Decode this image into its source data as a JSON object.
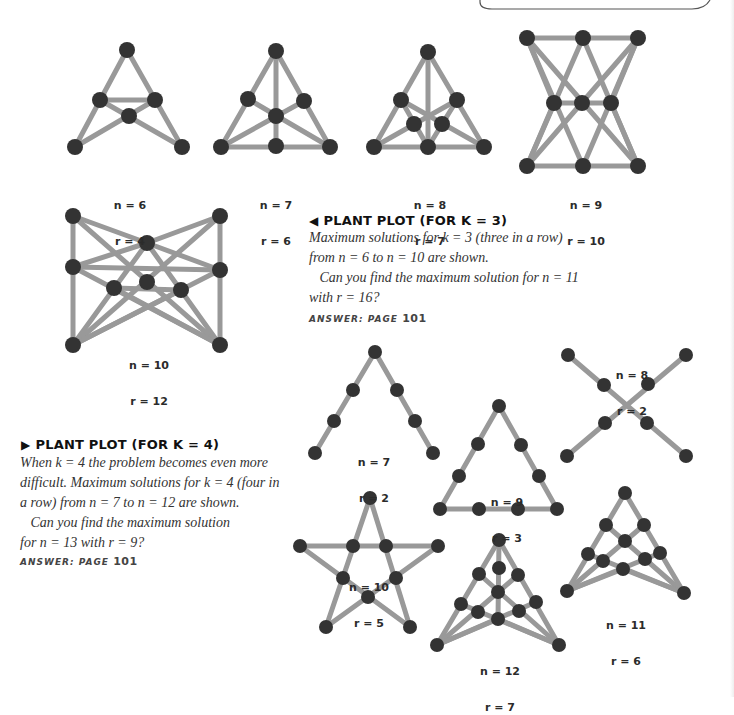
{
  "page": {
    "colors": {
      "edge": "#999999",
      "node": "#333333",
      "text": "#333333",
      "background": "#ffffff"
    }
  },
  "section_k3": {
    "heading_arrow": "◀",
    "heading": "PLANT PLOT (FOR K = 3)",
    "body_lines": [
      "Maximum solutions for k = 3 (three in a row)",
      "from n = 6 to n = 10 are shown.",
      "   Can you find the maximum solution for n = 11",
      "with r = 16?"
    ],
    "answer_label": "ANSWER: PAGE ",
    "answer_page": "101",
    "figures": [
      {
        "n_label": "n = 6",
        "r_label": "r = 4"
      },
      {
        "n_label": "n = 7",
        "r_label": "r = 6"
      },
      {
        "n_label": "n = 8",
        "r_label": "r = 7"
      },
      {
        "n_label": "n = 9",
        "r_label": "r = 10"
      },
      {
        "n_label": "n = 10",
        "r_label": "r = 12"
      }
    ]
  },
  "section_k4": {
    "heading_arrow": "▶",
    "heading": "PLANT PLOT (FOR K = 4)",
    "body_lines": [
      "When k = 4 the problem becomes even more",
      "difficult. Maximum solutions for k = 4 (four in",
      "a row) from n = 7 to n = 12 are shown.",
      "   Can you find the maximum solution",
      "for n = 13 with r = 9?"
    ],
    "answer_label": "ANSWER: PAGE ",
    "answer_page": "101",
    "figures": [
      {
        "n_label": "n = 7",
        "r_label": "r = 2"
      },
      {
        "n_label": "n = 8",
        "r_label": "r = 2"
      },
      {
        "n_label": "n = 9",
        "r_label": "r = 3"
      },
      {
        "n_label": "n = 10",
        "r_label": "r = 5"
      },
      {
        "n_label": "n = 11",
        "r_label": "r = 6"
      },
      {
        "n_label": "n = 12",
        "r_label": "r = 7"
      }
    ]
  }
}
